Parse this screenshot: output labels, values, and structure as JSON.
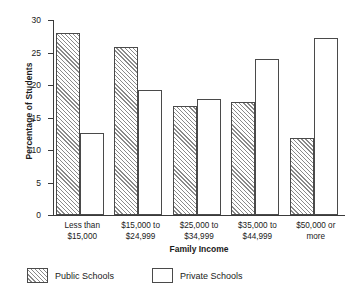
{
  "chart_data": {
    "type": "bar",
    "title": "",
    "xlabel": "Family Income",
    "ylabel": "Percentage of Students",
    "categories": [
      "Less than\n$15,000",
      "$15,000 to\n$24,999",
      "$25,000 to\n$34,999",
      "$35,000 to\n$44,999",
      "$50,000 or\nmore"
    ],
    "series": [
      {
        "name": "Public Schools",
        "pattern": "diagonal-hatch",
        "values": [
          28.0,
          25.8,
          16.7,
          17.4,
          11.9
        ]
      },
      {
        "name": "Private Schools",
        "pattern": "solid-white",
        "values": [
          12.6,
          19.3,
          17.8,
          24.0,
          27.3
        ]
      }
    ],
    "ylim": [
      0,
      30
    ],
    "yticks": [
      0,
      5,
      10,
      15,
      20,
      25,
      30
    ],
    "ytick_labels": [
      "0",
      "5",
      "10",
      "15",
      "20",
      "25",
      "30"
    ],
    "grid": false,
    "legend_position": "bottom-left",
    "colors": {
      "bar_edge": "#4a4a4a",
      "hatch": "#8a8a8a",
      "fill": "#ffffff",
      "axis": "#3a3a3a",
      "text": "#1a1a1a"
    }
  }
}
